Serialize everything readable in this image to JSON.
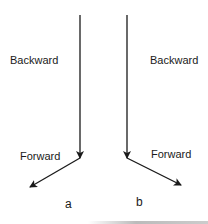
{
  "diagram": {
    "panels": [
      {
        "id": "a",
        "caption": "a",
        "upper_label": "Backward",
        "lower_label": "Forward",
        "vertical_arrow": {
          "x1": 80,
          "y1": 15,
          "x2": 80,
          "y2": 158
        },
        "diagonal_arrow": {
          "x1": 80,
          "y1": 158,
          "x2": 30,
          "y2": 187
        }
      },
      {
        "id": "b",
        "caption": "b",
        "upper_label": "Backward",
        "lower_label": "Forward",
        "vertical_arrow": {
          "x1": 127,
          "y1": 15,
          "x2": 127,
          "y2": 158
        },
        "diagonal_arrow": {
          "x1": 127,
          "y1": 158,
          "x2": 181,
          "y2": 185
        }
      }
    ],
    "colors": {
      "stroke": "#1a1a1a",
      "text": "#1a1a1a",
      "background": "#ffffff"
    }
  }
}
